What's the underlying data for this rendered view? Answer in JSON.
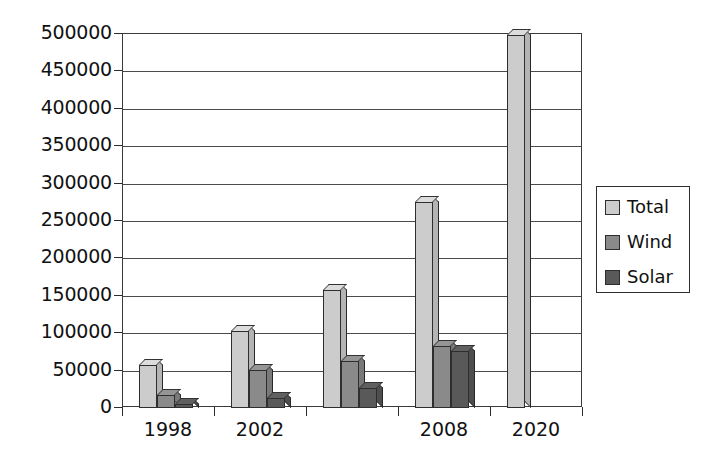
{
  "chart_data": {
    "type": "bar",
    "title": "",
    "subtitle": "",
    "xlabel": "",
    "ylabel": "",
    "grid": true,
    "legend_position": "right",
    "categories": [
      "1998",
      "2002",
      "",
      "2008",
      "2020"
    ],
    "tick_labels_visible": [
      "1998",
      "2002",
      "2008",
      "2020"
    ],
    "ylim": [
      0,
      500000
    ],
    "ytick_step": 50000,
    "ytick_labels": [
      "500000",
      "450000",
      "400000",
      "350000",
      "300000",
      "250000",
      "200000",
      "150000",
      "100000",
      "50000",
      "0"
    ],
    "ytick_values": [
      500000,
      450000,
      400000,
      350000,
      300000,
      250000,
      200000,
      150000,
      100000,
      50000,
      0
    ],
    "series": [
      {
        "name": "Total",
        "color": "#cccccc",
        "values": [
          57000,
          103000,
          158000,
          275000,
          499000
        ]
      },
      {
        "name": "Wind",
        "color": "#8a8a8a",
        "values": [
          17000,
          51000,
          63000,
          83000,
          0
        ]
      },
      {
        "name": "Solar",
        "color": "#595959",
        "values": [
          5000,
          13000,
          27000,
          76000,
          0
        ]
      }
    ]
  },
  "legend": {
    "items": [
      {
        "label": "Total",
        "color": "#cccccc"
      },
      {
        "label": "Wind",
        "color": "#8a8a8a"
      },
      {
        "label": "Solar",
        "color": "#595959"
      }
    ]
  },
  "colors": {
    "total": "#cccccc",
    "wind": "#8a8a8a",
    "solar": "#595959",
    "axis": "#2c2c2c",
    "gridline": "#4a4a4a",
    "background": "#ffffff"
  }
}
